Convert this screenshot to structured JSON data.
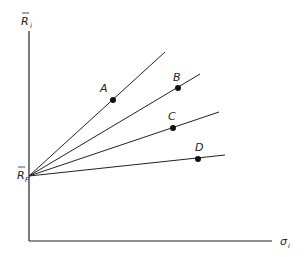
{
  "diagram": {
    "y_axis_label": "R",
    "y_axis_sub": "i",
    "x_axis_label": "σ",
    "x_axis_sub": "i",
    "origin_label": "R",
    "origin_sub": "F",
    "line_color": "#222222",
    "points": [
      {
        "label": "A"
      },
      {
        "label": "B"
      },
      {
        "label": "C"
      },
      {
        "label": "D"
      }
    ]
  }
}
